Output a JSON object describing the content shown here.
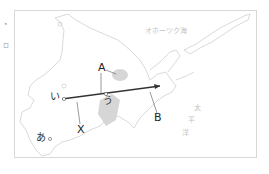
{
  "map": {
    "region": "Hokkaido",
    "sea_labels": {
      "okhotsk": "オホーツク海",
      "pacific_1": "太",
      "pacific_2": "平",
      "pacific_3": "洋"
    },
    "point_labels": {
      "a": "A",
      "b": "B",
      "x": "X",
      "i": "い",
      "u": "う",
      "ah": "あ"
    },
    "margin_marks": [
      "•",
      "ロ"
    ],
    "colors": {
      "coast": "#cfcfcf",
      "line": "#333333",
      "shade": "#d6d6d6",
      "frame": "#d8d8d8"
    }
  }
}
